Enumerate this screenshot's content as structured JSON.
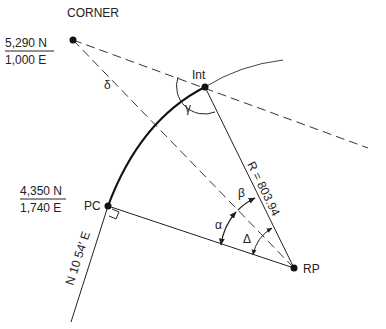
{
  "diagram": {
    "title": "CORNER",
    "corner_coords": {
      "north": "5,290 N",
      "east": "1,000 E"
    },
    "pc_coords": {
      "north": "4,350 N",
      "east": "1,740 E"
    },
    "points": {
      "int": "Int",
      "pc": "PC",
      "rp": "RP"
    },
    "angles": {
      "delta_small": "δ",
      "gamma": "γ",
      "alpha": "α",
      "beta": "β",
      "delta_cap": "Δ"
    },
    "radius_label": "R = 803.94",
    "bearing_label": "N 10  54′ E",
    "colors": {
      "line": "#222222",
      "background": "#ffffff"
    }
  }
}
